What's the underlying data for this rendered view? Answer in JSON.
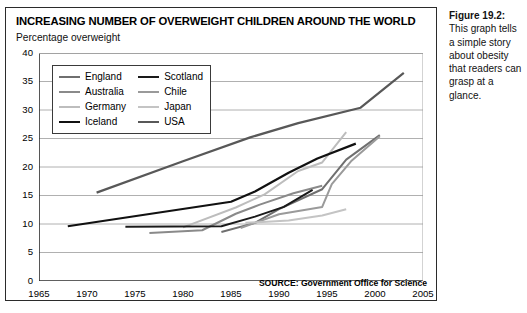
{
  "figure": {
    "title": "INCREASING NUMBER OF OVERWEIGHT CHILDREN AROUND THE WORLD",
    "caption_label": "Figure 19.2:",
    "caption_text": "This graph tells a simple story about obesity that readers can grasp at a glance."
  },
  "chart_data": {
    "type": "line",
    "title": "INCREASING NUMBER OF OVERWEIGHT CHILDREN AROUND THE WORLD",
    "subtitle": "Percentage overweight",
    "xlabel": "",
    "ylabel": "Percentage overweight",
    "source": "SOURCE: Government Office for Science",
    "xlim": [
      1965,
      2005
    ],
    "ylim": [
      0,
      40
    ],
    "xticks": [
      1965,
      1970,
      1975,
      1980,
      1985,
      1990,
      1995,
      2000,
      2005
    ],
    "yticks": [
      0,
      5,
      10,
      15,
      20,
      25,
      30,
      35,
      40
    ],
    "grid": "horizontal",
    "legend_position": "upper-left-inside",
    "series": [
      {
        "name": "England",
        "color": "#6f6f6f",
        "width": 2.0,
        "points": [
          [
            1984,
            8.6
          ],
          [
            1987.5,
            10.2
          ],
          [
            1990,
            12.6
          ],
          [
            1994.5,
            16.1
          ],
          [
            1997,
            21.3
          ],
          [
            2000.5,
            25.6
          ]
        ]
      },
      {
        "name": "Australia",
        "color": "#8a8a8a",
        "width": 2.0,
        "points": [
          [
            1976.5,
            8.4
          ],
          [
            1982,
            8.9
          ],
          [
            1985.5,
            11.8
          ],
          [
            1988,
            13.4
          ],
          [
            1991.5,
            15.4
          ],
          [
            1994.5,
            16.7
          ]
        ]
      },
      {
        "name": "Germany",
        "color": "#bdbdbd",
        "width": 2.0,
        "points": [
          [
            1980,
            9.4
          ],
          [
            1985.5,
            12.9
          ],
          [
            1988.5,
            15.2
          ],
          [
            1992,
            19.3
          ],
          [
            1994.5,
            20.8
          ],
          [
            1997,
            26.1
          ]
        ]
      },
      {
        "name": "Iceland",
        "color": "#111111",
        "width": 2.2,
        "points": [
          [
            1968,
            9.6
          ],
          [
            1985,
            13.9
          ],
          [
            1987.5,
            15.7
          ],
          [
            1991,
            19.0
          ],
          [
            1994,
            21.5
          ],
          [
            1998,
            24.1
          ]
        ]
      },
      {
        "name": "Scotland",
        "color": "#1a1a1a",
        "width": 2.0,
        "points": [
          [
            1974,
            9.5
          ],
          [
            1984,
            9.6
          ],
          [
            1987.5,
            11.3
          ],
          [
            1990.5,
            13.0
          ],
          [
            1993.5,
            16.0
          ]
        ]
      },
      {
        "name": "Chile",
        "color": "#9a9a9a",
        "width": 2.0,
        "points": [
          [
            1986,
            9.3
          ],
          [
            1990,
            11.7
          ],
          [
            1994.5,
            13.0
          ],
          [
            1995.5,
            17.0
          ],
          [
            1997.5,
            21.0
          ],
          [
            2000.5,
            25.4
          ]
        ]
      },
      {
        "name": "Japan",
        "color": "#c4c4c4",
        "width": 2.0,
        "points": [
          [
            1986.5,
            10.2
          ],
          [
            1991,
            10.6
          ],
          [
            1994.5,
            11.5
          ],
          [
            1997,
            12.6
          ]
        ]
      },
      {
        "name": "USA",
        "color": "#585858",
        "width": 2.2,
        "points": [
          [
            1971,
            15.5
          ],
          [
            1980,
            21.0
          ],
          [
            1987,
            25.2
          ],
          [
            1992,
            27.7
          ],
          [
            1998.5,
            30.4
          ],
          [
            2003,
            36.5
          ]
        ]
      }
    ]
  },
  "legend": {
    "column_left": [
      {
        "label": "England",
        "color": "#6f6f6f",
        "width": 2.2
      },
      {
        "label": "Australia",
        "color": "#8a8a8a",
        "width": 2.2
      },
      {
        "label": "Germany",
        "color": "#bdbdbd",
        "width": 2.2
      },
      {
        "label": "Iceland",
        "color": "#111111",
        "width": 2.8
      }
    ],
    "column_right": [
      {
        "label": "Scotland",
        "color": "#1a1a1a",
        "width": 2.8
      },
      {
        "label": "Chile",
        "color": "#9a9a9a",
        "width": 2.2
      },
      {
        "label": "Japan",
        "color": "#c4c4c4",
        "width": 2.2
      },
      {
        "label": "USA",
        "color": "#585858",
        "width": 2.4
      }
    ]
  }
}
